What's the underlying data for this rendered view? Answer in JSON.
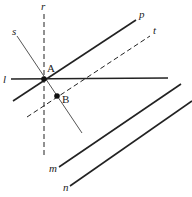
{
  "figure": {
    "lines": [
      {
        "id": "r",
        "label": "r",
        "style": "dashed",
        "x1": 44,
        "y1": 14,
        "x2": 44,
        "y2": 156,
        "lx": 41,
        "ly": 10
      },
      {
        "id": "l",
        "label": "l",
        "style": "solid",
        "x1": 11,
        "y1": 79,
        "x2": 168,
        "y2": 78,
        "lx": 3,
        "ly": 83
      },
      {
        "id": "p",
        "label": "p",
        "style": "solid",
        "x1": 13,
        "y1": 101,
        "x2": 136,
        "y2": 20,
        "lx": 139,
        "ly": 18
      },
      {
        "id": "t",
        "label": "t",
        "style": "dashed",
        "x1": 27,
        "y1": 117,
        "x2": 150,
        "y2": 36,
        "lx": 153,
        "ly": 34
      },
      {
        "id": "s",
        "label": "s",
        "style": "solid-thin",
        "x1": 17,
        "y1": 36,
        "x2": 82,
        "y2": 133,
        "lx": 12,
        "ly": 35
      },
      {
        "id": "m",
        "label": "m",
        "style": "solid",
        "x1": 59,
        "y1": 167,
        "x2": 181,
        "y2": 84,
        "lx": 49,
        "ly": 172
      },
      {
        "id": "n",
        "label": "n",
        "style": "solid",
        "x1": 70,
        "y1": 186,
        "x2": 192,
        "y2": 101,
        "lx": 63,
        "ly": 191
      }
    ],
    "points": [
      {
        "id": "A",
        "label": "A",
        "x": 44,
        "y": 79,
        "lx": 47,
        "ly": 72
      },
      {
        "id": "B",
        "label": "B",
        "x": 57,
        "y": 96,
        "lx": 62,
        "ly": 103
      }
    ]
  }
}
